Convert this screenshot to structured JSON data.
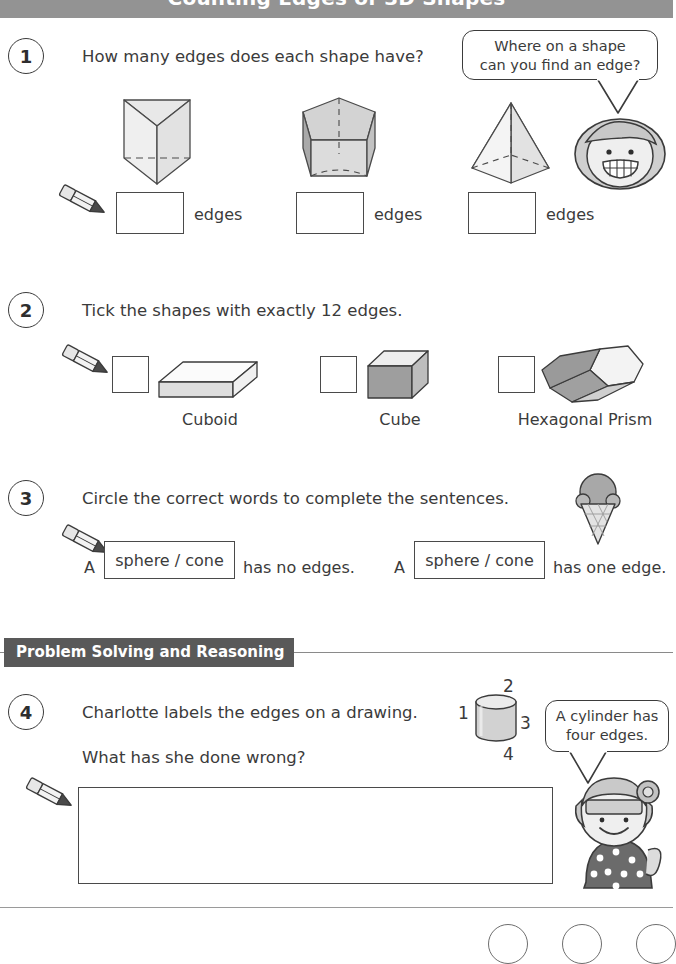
{
  "header": {
    "title": "Counting Edges of 3D Shapes"
  },
  "questions": [
    {
      "number": "1",
      "prompt": "How many edges does each shape have?",
      "bubble": "Where on a shape\ncan you find an edge?",
      "bubble_line1": "Where on a shape",
      "bubble_line2": "can you find an edge?",
      "answer_unit": "edges",
      "shapes": [
        "triangular-prism",
        "pentagonal-prism",
        "square-pyramid"
      ],
      "answers": [
        "",
        "",
        ""
      ]
    },
    {
      "number": "2",
      "prompt": "Tick the shapes with exactly 12 edges.",
      "items": [
        {
          "label": "Cuboid",
          "shape": "cuboid",
          "ticked": ""
        },
        {
          "label": "Cube",
          "shape": "cube",
          "ticked": ""
        },
        {
          "label": "Hexagonal Prism",
          "shape": "hexagonal-prism",
          "ticked": ""
        }
      ]
    },
    {
      "number": "3",
      "prompt": "Circle the correct words to complete the sentences.",
      "sentences": [
        {
          "lead": "A",
          "choice": "sphere / cone",
          "tail": "has no edges."
        },
        {
          "lead": "A",
          "choice": "sphere / cone",
          "tail": "has one edge."
        }
      ]
    },
    {
      "number": "4",
      "prompt_line1": "Charlotte labels the edges on a drawing.",
      "prompt_line2": "What has she done wrong?",
      "bubble_line1": "A cylinder has",
      "bubble_line2": "four edges.",
      "cylinder_labels": {
        "top": "2",
        "left": "1",
        "right": "3",
        "bottom": "4"
      },
      "answer": ""
    }
  ],
  "section": {
    "label": "Problem Solving and Reasoning"
  },
  "colors": {
    "header_bg": "#939393",
    "section_tag_bg": "#595959",
    "ink": "#3b3b3b",
    "shape_light": "#efefef",
    "shape_mid": "#cdcdcd",
    "shape_dark": "#9b9b9b"
  }
}
